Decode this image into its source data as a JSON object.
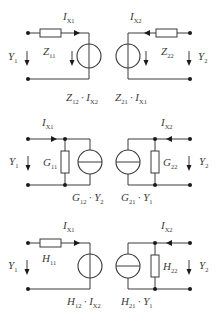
{
  "diagram": {
    "circuits": [
      {
        "name": "Z-parameter",
        "left": {
          "current": {
            "sym": "I",
            "sub": "X1"
          },
          "voltage": {
            "sym": "Y",
            "sub": "1"
          },
          "element": {
            "sym": "Z",
            "sub": "11",
            "kind": "series-impedance"
          },
          "source": {
            "kind": "voltage-source",
            "expr": [
              {
                "sym": "Z",
                "sub": "12"
              },
              {
                "op": "·"
              },
              {
                "sym": "I",
                "sub": "X2"
              }
            ]
          }
        },
        "right": {
          "current": {
            "sym": "I",
            "sub": "X2"
          },
          "voltage": {
            "sym": "Y",
            "sub": "2"
          },
          "element": {
            "sym": "Z",
            "sub": "22",
            "kind": "series-impedance"
          },
          "source": {
            "kind": "voltage-source",
            "expr": [
              {
                "sym": "Z",
                "sub": "21"
              },
              {
                "op": "·"
              },
              {
                "sym": "I",
                "sub": "X1"
              }
            ]
          }
        }
      },
      {
        "name": "G-parameter",
        "left": {
          "current": {
            "sym": "I",
            "sub": "X1"
          },
          "voltage": {
            "sym": "Y",
            "sub": "1"
          },
          "element": {
            "sym": "G",
            "sub": "11",
            "kind": "shunt-admittance"
          },
          "source": {
            "kind": "current-source",
            "expr": [
              {
                "sym": "G",
                "sub": "12"
              },
              {
                "op": "·"
              },
              {
                "sym": "Y",
                "sub": "2"
              }
            ]
          }
        },
        "right": {
          "current": {
            "sym": "I",
            "sub": "X2"
          },
          "voltage": {
            "sym": "Y",
            "sub": "2"
          },
          "element": {
            "sym": "G",
            "sub": "22",
            "kind": "shunt-admittance"
          },
          "source": {
            "kind": "current-source",
            "expr": [
              {
                "sym": "G",
                "sub": "21"
              },
              {
                "op": "·"
              },
              {
                "sym": "Y",
                "sub": "1"
              }
            ]
          }
        }
      },
      {
        "name": "H-parameter",
        "left": {
          "current": {
            "sym": "I",
            "sub": "X1"
          },
          "voltage": {
            "sym": "Y",
            "sub": "1"
          },
          "element": {
            "sym": "H",
            "sub": "11",
            "kind": "series-impedance"
          },
          "source": {
            "kind": "voltage-source",
            "expr": [
              {
                "sym": "H",
                "sub": "12"
              },
              {
                "op": "·"
              },
              {
                "sym": "I",
                "sub": "X2"
              }
            ]
          }
        },
        "right": {
          "current": {
            "sym": "I",
            "sub": "X2"
          },
          "voltage": {
            "sym": "Y",
            "sub": "2"
          },
          "element": {
            "sym": "H",
            "sub": "22",
            "kind": "shunt-admittance"
          },
          "source": {
            "kind": "current-source",
            "expr": [
              {
                "sym": "H",
                "sub": "21"
              },
              {
                "op": "·"
              },
              {
                "sym": "Y",
                "sub": "1"
              }
            ]
          }
        }
      }
    ]
  },
  "colors": {
    "line": "#3a3a3a",
    "dot": "#1a1a1a",
    "background": "#ffffff"
  }
}
